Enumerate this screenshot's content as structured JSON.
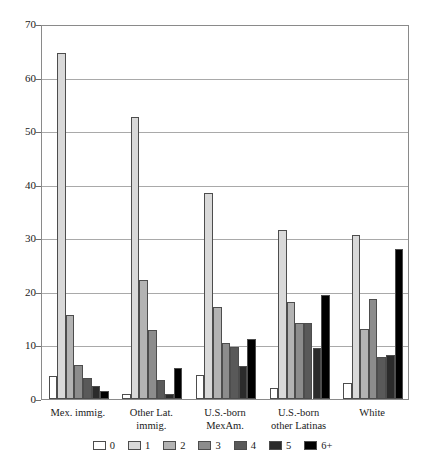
{
  "chart_data": {
    "type": "bar",
    "title": "",
    "subtitle": "",
    "xlabel": "",
    "ylabel": "",
    "ylim": [
      0,
      70
    ],
    "yticks": [
      0,
      10,
      20,
      30,
      40,
      50,
      60,
      70
    ],
    "grid": true,
    "legend_position": "bottom",
    "categories": [
      "Mex. immig.",
      "Other Lat. immig.",
      "U.S.-born MexAm.",
      "U.S.-born other Latinas",
      "White"
    ],
    "category_lines": [
      [
        "Mex. immig."
      ],
      [
        "Other Lat.",
        "immig."
      ],
      [
        "U.S.-born",
        "MexAm."
      ],
      [
        "U.S.-born",
        "other Latinas"
      ],
      [
        "White"
      ]
    ],
    "series": [
      {
        "name": "0",
        "color": "#ffffff",
        "values": [
          4.3,
          1.0,
          4.5,
          2.1,
          3.0
        ]
      },
      {
        "name": "1",
        "color": "#d9d9d9",
        "values": [
          64.5,
          52.7,
          38.4,
          31.5,
          30.7
        ]
      },
      {
        "name": "2",
        "color": "#b3b3b3",
        "values": [
          15.7,
          22.2,
          17.2,
          18.2,
          13.0
        ]
      },
      {
        "name": "3",
        "color": "#8c8c8c",
        "values": [
          6.3,
          12.9,
          10.5,
          14.2,
          18.6
        ]
      },
      {
        "name": "4",
        "color": "#595959",
        "values": [
          4.0,
          3.5,
          9.8,
          14.2,
          7.8
        ]
      },
      {
        "name": "5",
        "color": "#2b2b2b",
        "values": [
          2.4,
          0.9,
          6.2,
          9.6,
          8.3
        ]
      },
      {
        "name": "6+",
        "color": "#000000",
        "values": [
          1.5,
          5.8,
          11.2,
          19.5,
          28.0
        ]
      }
    ]
  },
  "legend": {
    "items": [
      {
        "label": "0"
      },
      {
        "label": "1"
      },
      {
        "label": "2"
      },
      {
        "label": "3"
      },
      {
        "label": "4"
      },
      {
        "label": "5"
      },
      {
        "label": "6+"
      }
    ]
  },
  "axis": {
    "y_tick_labels": [
      "70",
      "60",
      "50",
      "40",
      "30",
      "20",
      "10",
      "0"
    ]
  }
}
